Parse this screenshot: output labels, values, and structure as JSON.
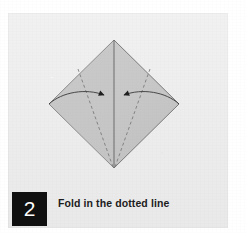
{
  "page": {
    "background_color": "#ffffff",
    "panel_color": "#efefef"
  },
  "step": {
    "number": "2",
    "badge_background": "#101010",
    "badge_text_color": "#ffffff",
    "caption": "Fold in the dotted line",
    "caption_color": "#1d1d1d"
  },
  "diagram": {
    "name": "origami-diamond-fold",
    "paper_fill": "#c9c9c9",
    "paper_stroke": "#6b6b6b",
    "fold_line_color": "#6b6b6b",
    "dashed_line_color": "#707070",
    "arrow_color": "#2b2b2b",
    "vertices": {
      "top": [
        114,
        40
      ],
      "left": [
        49,
        104
      ],
      "right": [
        179,
        104
      ],
      "bottom": [
        114,
        168
      ]
    },
    "center_fold": {
      "from": [
        114,
        40
      ],
      "to": [
        114,
        168
      ]
    },
    "dashed_folds": [
      {
        "from": [
          78,
          70
        ],
        "to": [
          114,
          168
        ]
      },
      {
        "from": [
          150,
          70
        ],
        "to": [
          114,
          168
        ]
      }
    ],
    "arrows": [
      {
        "name": "left-fold-arrow",
        "from": [
          49,
          104
        ],
        "to": [
          107,
          96
        ],
        "direction": "right"
      },
      {
        "name": "right-fold-arrow",
        "from": [
          179,
          104
        ],
        "to": [
          121,
          96
        ],
        "direction": "left"
      }
    ]
  }
}
